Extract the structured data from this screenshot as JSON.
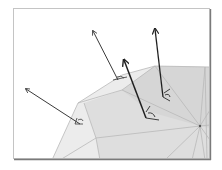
{
  "figure": {
    "title": "",
    "colors": {
      "background": "#ffffff",
      "frame": "#b8b8b8",
      "frame_shadow": "#7a7a7a",
      "mesh_face_light": "#ececec",
      "mesh_face_mid": "#dedede",
      "mesh_face_dark": "#d4d4d4",
      "mesh_edge": "#b9b9b9",
      "arrow": "#3a3a3a",
      "arrow_bold": "#1f1f1f"
    },
    "normals": [
      {
        "id": "n1",
        "label": "",
        "base": [
          80,
          124
        ],
        "tip": [
          26,
          89
        ],
        "weight": "normal"
      },
      {
        "id": "n2",
        "label": "",
        "base": [
          118,
          80
        ],
        "tip": [
          93,
          31
        ],
        "weight": "normal"
      },
      {
        "id": "n3",
        "label": "",
        "base": [
          146,
          118
        ],
        "tip": [
          124,
          60
        ],
        "weight": "bold"
      },
      {
        "id": "n4",
        "label": "",
        "base": [
          163,
          97
        ],
        "tip": [
          155,
          29
        ],
        "weight": "bold"
      }
    ],
    "vertex": {
      "label": "",
      "position": [
        200,
        126
      ]
    }
  }
}
